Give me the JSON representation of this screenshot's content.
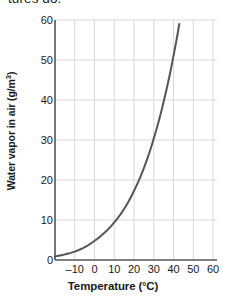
{
  "caption": {
    "partial_text": "tures do."
  },
  "chart_data": {
    "type": "line",
    "title": "",
    "xlabel": "Temperature (°C)",
    "ylabel_text": "Water vapor in air (g/m",
    "ylabel_sup": "3",
    "ylabel_close": ")",
    "ylabel_full": "Water vapor in air (g/m³)",
    "xlim": [
      -20,
      62
    ],
    "ylim": [
      0,
      60
    ],
    "xticks": [
      -10,
      0,
      10,
      20,
      30,
      40,
      50,
      60
    ],
    "xtick_labels": [
      "–10",
      "0",
      "10",
      "20",
      "30",
      "40",
      "50",
      "60"
    ],
    "yticks": [
      0,
      10,
      20,
      30,
      40,
      50,
      60
    ],
    "ytick_labels": [
      "0",
      "10",
      "20",
      "30",
      "40",
      "50",
      "60"
    ],
    "grid": true,
    "legend": "none",
    "series": [
      {
        "name": "Saturation water vapor capacity",
        "color": "#555555",
        "x": [
          -20,
          -15,
          -10,
          -5,
          0,
          5,
          10,
          15,
          20,
          25,
          30,
          35,
          40,
          45
        ],
        "values": [
          0.9,
          1.4,
          2.1,
          3.2,
          4.8,
          6.8,
          9.4,
          12.8,
          17.3,
          23.0,
          30.4,
          39.6,
          51.1,
          65.4
        ]
      }
    ],
    "axis_color": "#555555",
    "grid_color": "#d8d8d8",
    "background": "#ffffff"
  }
}
